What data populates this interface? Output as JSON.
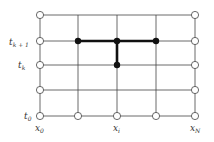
{
  "diagram": {
    "type": "finite-difference-stencil-grid",
    "columns_x": [
      40,
      78,
      117,
      156,
      195
    ],
    "rows_y": [
      15,
      41,
      65,
      90,
      116
    ],
    "grid_color": "#444444",
    "stencil_color": "#111111",
    "boundary_nodes": [
      [
        40,
        15
      ],
      [
        195,
        15
      ],
      [
        40,
        41
      ],
      [
        195,
        41
      ],
      [
        40,
        65
      ],
      [
        195,
        65
      ],
      [
        40,
        90
      ],
      [
        195,
        90
      ],
      [
        40,
        116
      ],
      [
        78,
        116
      ],
      [
        117,
        116
      ],
      [
        156,
        116
      ],
      [
        195,
        116
      ]
    ],
    "stencil_nodes": [
      [
        78,
        41
      ],
      [
        117,
        41
      ],
      [
        156,
        41
      ],
      [
        117,
        65
      ]
    ],
    "stencil_edges": [
      [
        [
          78,
          41
        ],
        [
          156,
          41
        ]
      ],
      [
        [
          117,
          41
        ],
        [
          117,
          65
        ]
      ]
    ],
    "labels": {
      "t_k1": {
        "base": "t",
        "sub": "k + 1"
      },
      "t_k": {
        "base": "t",
        "sub": "k"
      },
      "t_0": {
        "base": "t",
        "sub": "0"
      },
      "x_0": {
        "base": "x",
        "sub": "0"
      },
      "x_i": {
        "base": "x",
        "sub": "i"
      },
      "x_N": {
        "base": "x",
        "sub": "N"
      }
    }
  }
}
